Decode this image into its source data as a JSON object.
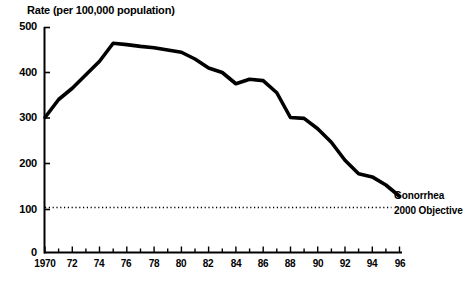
{
  "chart_data": {
    "type": "line",
    "title": "Rate (per 100,000 population)",
    "xlabel": "",
    "ylabel": "Rate (per 100,000 population)",
    "xlim": [
      1970,
      1996
    ],
    "ylim": [
      0,
      500
    ],
    "grid": false,
    "legend_position": "inline-right",
    "x": [
      1970,
      1971,
      1972,
      1973,
      1974,
      1975,
      1976,
      1977,
      1978,
      1979,
      1980,
      1981,
      1982,
      1983,
      1984,
      1985,
      1986,
      1987,
      1988,
      1989,
      1990,
      1991,
      1992,
      1993,
      1994,
      1995,
      1996
    ],
    "series": [
      {
        "name": "Gonorrhea",
        "values": [
          300,
          340,
          365,
          395,
          425,
          465,
          462,
          458,
          455,
          450,
          445,
          430,
          410,
          400,
          375,
          385,
          382,
          355,
          300,
          298,
          275,
          245,
          205,
          175,
          168,
          150,
          125
        ]
      },
      {
        "name": "2000 Objective",
        "style": "dotted",
        "constant_value": 100,
        "values": [
          100,
          100,
          100,
          100,
          100,
          100,
          100,
          100,
          100,
          100,
          100,
          100,
          100,
          100,
          100,
          100,
          100,
          100,
          100,
          100,
          100,
          100,
          100,
          100,
          100,
          100,
          100
        ]
      }
    ],
    "y_ticks": [
      0,
      100,
      200,
      300,
      400,
      500
    ],
    "y_tick_labels": [
      "0",
      "100",
      "200",
      "300",
      "400",
      "500"
    ],
    "x_major_ticks": [
      1970,
      1972,
      1974,
      1976,
      1978,
      1980,
      1982,
      1984,
      1986,
      1988,
      1990,
      1992,
      1994,
      1996
    ],
    "x_tick_labels": [
      "1970",
      "72",
      "74",
      "76",
      "78",
      "80",
      "82",
      "84",
      "86",
      "88",
      "90",
      "92",
      "94",
      "96"
    ],
    "x_minor_tick_step": 1,
    "annotations": [
      {
        "text": "Gonorrhea",
        "at_year": 1996,
        "at_value": 125
      },
      {
        "text": "2000 Objective",
        "at_year": 1996,
        "at_value": 100
      }
    ],
    "colors": {
      "series_line": "#000000",
      "objective_line": "#000000",
      "axis": "#000000",
      "background": "#ffffff"
    }
  }
}
